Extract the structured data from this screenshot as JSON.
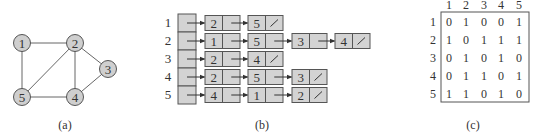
{
  "colors": {
    "node_fill": "#cfcfcf",
    "cell_fill": "#d3d3d3",
    "stroke": "#555555",
    "edge": "#666666",
    "text": "#333333"
  },
  "graph": {
    "caption": "(a)",
    "nodes": [
      {
        "id": "1",
        "x": 22,
        "y": 43
      },
      {
        "id": "2",
        "x": 75,
        "y": 43
      },
      {
        "id": "3",
        "x": 108,
        "y": 69
      },
      {
        "id": "4",
        "x": 75,
        "y": 97
      },
      {
        "id": "5",
        "x": 22,
        "y": 97
      }
    ],
    "edges": [
      [
        "1",
        "2"
      ],
      [
        "1",
        "5"
      ],
      [
        "2",
        "5"
      ],
      [
        "2",
        "4"
      ],
      [
        "2",
        "3"
      ],
      [
        "3",
        "4"
      ],
      [
        "4",
        "5"
      ]
    ]
  },
  "adjacency_list": {
    "caption": "(b)",
    "null_symbol": "/",
    "rows": [
      {
        "label": "1",
        "neighbors": [
          "2",
          "5"
        ]
      },
      {
        "label": "2",
        "neighbors": [
          "1",
          "5",
          "3",
          "4"
        ]
      },
      {
        "label": "3",
        "neighbors": [
          "2",
          "4"
        ]
      },
      {
        "label": "4",
        "neighbors": [
          "2",
          "5",
          "3"
        ]
      },
      {
        "label": "5",
        "neighbors": [
          "4",
          "1",
          "2"
        ]
      }
    ]
  },
  "adjacency_matrix": {
    "caption": "(c)",
    "col_headers": [
      "1",
      "2",
      "3",
      "4",
      "5"
    ],
    "row_headers": [
      "1",
      "2",
      "3",
      "4",
      "5"
    ],
    "values": [
      [
        "0",
        "1",
        "0",
        "0",
        "1"
      ],
      [
        "1",
        "0",
        "1",
        "1",
        "1"
      ],
      [
        "0",
        "1",
        "0",
        "1",
        "0"
      ],
      [
        "0",
        "1",
        "1",
        "0",
        "1"
      ],
      [
        "1",
        "1",
        "0",
        "1",
        "0"
      ]
    ]
  }
}
